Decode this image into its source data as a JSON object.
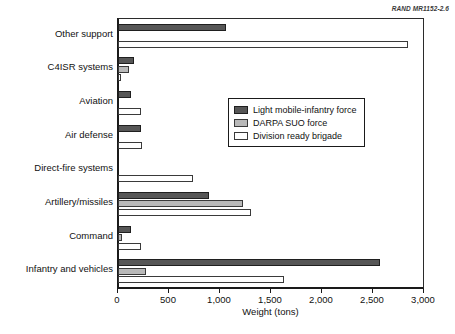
{
  "source_note": "RAND MR1152-2.6",
  "chart_data": {
    "type": "bar",
    "orientation": "horizontal",
    "title": "",
    "xlabel": "Weight (tons)",
    "ylabel": "",
    "xlim": [
      0,
      3000
    ],
    "xticks": [
      0,
      500,
      1000,
      1500,
      2000,
      2500,
      3000
    ],
    "xtick_labels": [
      "0",
      "500",
      "1,000",
      "1,500",
      "2,000",
      "2,500",
      "3,000"
    ],
    "grid": false,
    "legend_position": "center-right",
    "categories": [
      "Other support",
      "C4ISR systems",
      "Aviation",
      "Air defense",
      "Direct-fire systems",
      "Artillery/missiles",
      "Command",
      "Infantry and vehicles"
    ],
    "series": [
      {
        "name": "Light mobile-infantry force",
        "color": "#565656",
        "values": [
          1055,
          160,
          130,
          225,
          0,
          890,
          130,
          2570
        ]
      },
      {
        "name": "DARPA SUO force",
        "color": "#b9b9b9",
        "values": [
          0,
          110,
          0,
          0,
          0,
          1230,
          40,
          275
        ]
      },
      {
        "name": "Division ready brigade",
        "color": "#ffffff",
        "values": [
          2845,
          25,
          225,
          235,
          735,
          1300,
          225,
          1630
        ]
      }
    ]
  }
}
